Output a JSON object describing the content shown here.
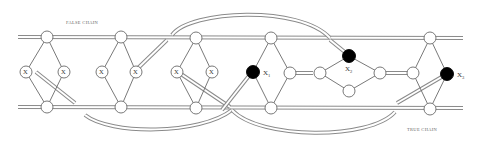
{
  "labels": {
    "false_chain": "FALSE CHAIN",
    "true_chain": "TRUE CHAIN"
  },
  "variables": [
    {
      "id": "x1_true",
      "label": "X",
      "sub": "1",
      "filled": true
    },
    {
      "id": "x2_true",
      "label": "X",
      "sub": "2",
      "filled": true
    },
    {
      "id": "x3_true",
      "label": "X",
      "sub": "3",
      "filled": true
    }
  ],
  "gadget_labels": {
    "g1_left": "X",
    "g1_right": "X",
    "g2_left": "X",
    "g2_right": "X",
    "g3_left": "X",
    "g3_right": "X"
  },
  "colors": {
    "line": "#8a8a8a",
    "edge": "#6a6a6a",
    "filled_node": "#000000",
    "open_node": "#ffffff"
  }
}
